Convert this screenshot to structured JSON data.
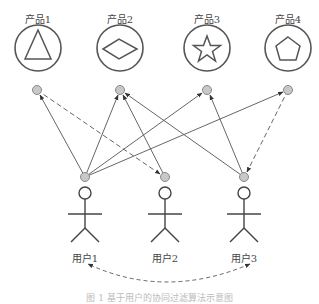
{
  "products": [
    {
      "label": "产品1",
      "icon": "triangle",
      "cx": 38,
      "cy": 48,
      "node": [
        37,
        90
      ]
    },
    {
      "label": "产品2",
      "icon": "diamond",
      "cx": 120,
      "cy": 48,
      "node": [
        120,
        90
      ]
    },
    {
      "label": "产品3",
      "icon": "star",
      "cx": 207,
      "cy": 48,
      "node": [
        207,
        90
      ]
    },
    {
      "label": "产品4",
      "icon": "pentagon",
      "cx": 288,
      "cy": 48,
      "node": [
        288,
        90
      ]
    }
  ],
  "users": [
    {
      "label": "用户1",
      "cx": 85,
      "node": [
        85,
        177
      ]
    },
    {
      "label": "用户2",
      "cx": 165,
      "node": [
        165,
        177
      ]
    },
    {
      "label": "用户3",
      "cx": 244,
      "node": [
        244,
        177
      ]
    }
  ],
  "edges": [
    {
      "from": "user1",
      "to": "product1",
      "style": "solid"
    },
    {
      "from": "user1",
      "to": "product2",
      "style": "solid"
    },
    {
      "from": "user1",
      "to": "product3",
      "style": "solid"
    },
    {
      "from": "user1",
      "to": "product4",
      "style": "solid"
    },
    {
      "from": "product1",
      "to": "user2",
      "style": "dashed"
    },
    {
      "from": "user2",
      "to": "product2",
      "style": "solid"
    },
    {
      "from": "user3",
      "to": "product2",
      "style": "solid"
    },
    {
      "from": "user3",
      "to": "product3",
      "style": "solid"
    },
    {
      "from": "product4",
      "to": "user3",
      "style": "dashed"
    },
    {
      "from": "user3",
      "to": "user1",
      "style": "dashed-curve-bidirectional"
    }
  ],
  "caption": "图 1  基于用户的协同过滤算法示意图",
  "colors": {
    "stroke": "#555555",
    "node_fill": "#c8c8c8",
    "node_stroke": "#888888"
  }
}
